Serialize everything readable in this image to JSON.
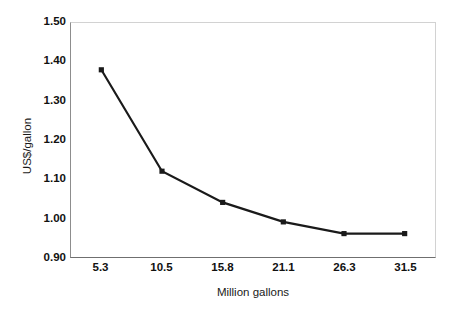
{
  "chart_data": {
    "type": "line",
    "title": "",
    "subtitle": "",
    "xlabel": "Million gallons",
    "ylabel": "US$/gallon",
    "categories": [
      "5.3",
      "10.5",
      "15.8",
      "21.1",
      "26.3",
      "31.5"
    ],
    "x": [
      5.3,
      10.5,
      15.8,
      21.1,
      26.3,
      31.5
    ],
    "values": [
      1.38,
      1.12,
      1.04,
      0.99,
      0.96,
      0.96
    ],
    "series": [
      {
        "name": "US$/gallon",
        "values": [
          1.38,
          1.12,
          1.04,
          0.99,
          0.96,
          0.96
        ]
      }
    ],
    "ylim": [
      0.9,
      1.5
    ],
    "ytick_labels": [
      "1.50",
      "1.40",
      "1.30",
      "1.20",
      "1.10",
      "1.00",
      "0.90"
    ],
    "ytick_values": [
      1.5,
      1.4,
      1.3,
      1.2,
      1.1,
      1.0,
      0.9
    ],
    "grid": false,
    "legend": false,
    "legend_position": "none",
    "line_color": "#1a1a1a",
    "marker_color": "#1a1a1a",
    "plot_border_color": "#d2d2d2",
    "axis_color": "#6f6f6f",
    "background_color": "#ffffff"
  }
}
